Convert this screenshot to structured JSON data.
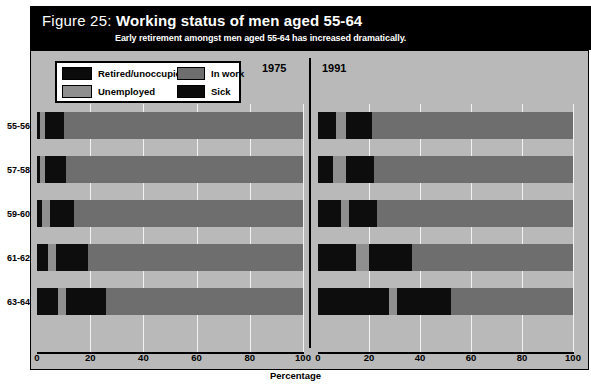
{
  "figure": {
    "label": "Figure 25:",
    "title": "Working status of men aged 55-64",
    "subtitle": "Early retirement amongst men aged 55-64 has increased dramatically."
  },
  "legend": {
    "items": [
      {
        "label": "Retired/unoccupied",
        "color": "#0d0d0d",
        "key": "retired"
      },
      {
        "label": "Unemployed",
        "color": "#8f8f8f",
        "key": "unemployed"
      },
      {
        "label": "In work",
        "color": "#6e6e6e",
        "key": "inwork"
      },
      {
        "label": "Sick",
        "color": "#0d0d0d",
        "key": "sick"
      }
    ]
  },
  "panels": [
    {
      "name": "panel-1975",
      "heading": "1975"
    },
    {
      "name": "panel-1991",
      "heading": "1991"
    }
  ],
  "axis": {
    "x_title": "Percentage",
    "x_ticks": [
      "0",
      "20",
      "40",
      "60",
      "80",
      "100"
    ],
    "y_categories": [
      "55-56",
      "57-58",
      "59-60",
      "61-62",
      "63-64"
    ]
  },
  "chart_data": {
    "type": "bar",
    "title": "Working status of men aged 55-64",
    "subtitle": "Early retirement amongst men aged 55-64 has increased dramatically.",
    "orientation": "horizontal",
    "stacked": true,
    "stack_order": [
      "Sick",
      "Unemployed",
      "Retired/unoccupied",
      "In work"
    ],
    "xlabel": "Percentage",
    "ylabel": "",
    "xlim": [
      0,
      100
    ],
    "xticks": [
      0,
      20,
      40,
      60,
      80,
      100
    ],
    "grid": true,
    "legend_position": "top-left",
    "categories": [
      "55-56",
      "57-58",
      "59-60",
      "61-62",
      "63-64"
    ],
    "panels": [
      {
        "name": "1975",
        "series": [
          {
            "name": "Sick",
            "color": "#0d0d0d",
            "values": [
              1,
              1,
              2,
              4,
              8
            ]
          },
          {
            "name": "Unemployed",
            "color": "#8f8f8f",
            "values": [
              2,
              2,
              3,
              3,
              3
            ]
          },
          {
            "name": "Retired/unoccupied",
            "color": "#0d0d0d",
            "values": [
              7,
              8,
              9,
              12,
              15
            ]
          },
          {
            "name": "In work",
            "color": "#6e6e6e",
            "values": [
              90,
              89,
              86,
              81,
              74
            ]
          }
        ]
      },
      {
        "name": "1991",
        "series": [
          {
            "name": "Sick",
            "color": "#0d0d0d",
            "values": [
              7,
              6,
              9,
              15,
              28
            ]
          },
          {
            "name": "Unemployed",
            "color": "#8f8f8f",
            "values": [
              4,
              5,
              3,
              5,
              3
            ]
          },
          {
            "name": "Retired/unoccupied",
            "color": "#0d0d0d",
            "values": [
              10,
              11,
              11,
              17,
              21
            ]
          },
          {
            "name": "In work",
            "color": "#6e6e6e",
            "values": [
              79,
              78,
              77,
              63,
              48
            ]
          }
        ]
      }
    ]
  }
}
